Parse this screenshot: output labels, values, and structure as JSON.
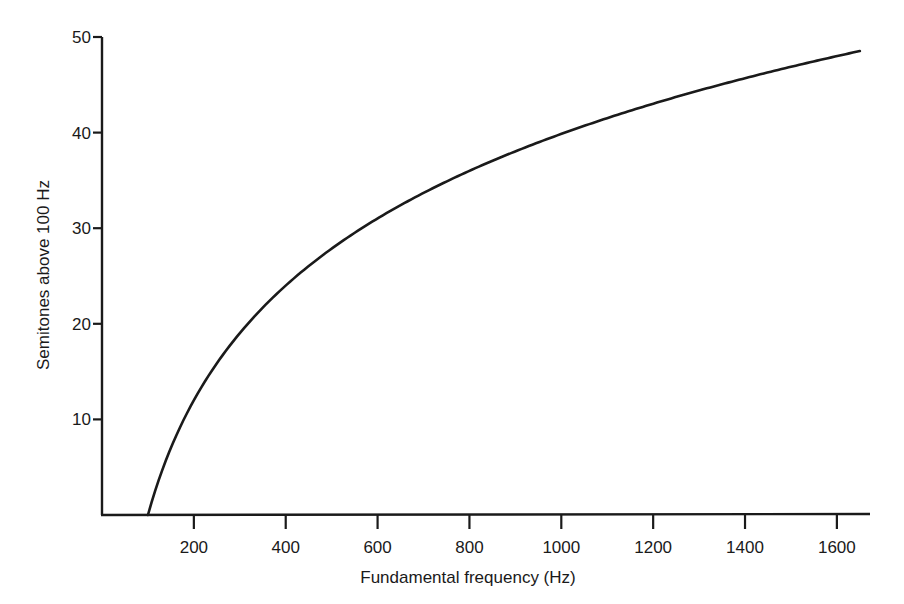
{
  "chart_data": {
    "type": "line",
    "title": "",
    "xlabel": "Fundamental frequency (Hz)",
    "ylabel": "Semitones above 100 Hz",
    "xlim": [
      0,
      1700
    ],
    "ylim": [
      0,
      50
    ],
    "grid": false,
    "legend": null,
    "x_ticks": [
      200,
      400,
      600,
      800,
      1000,
      1200,
      1400,
      1600
    ],
    "y_ticks": [
      10,
      20,
      30,
      40,
      50
    ],
    "series": [
      {
        "name": "Semitones above 100 Hz",
        "x": [
          100,
          125,
          150,
          175,
          200,
          250,
          300,
          350,
          400,
          500,
          600,
          700,
          800,
          900,
          1000,
          1100,
          1200,
          1300,
          1400,
          1500,
          1600,
          1650
        ],
        "y": [
          0,
          3.9,
          7.0,
          9.7,
          12.0,
          15.9,
          19.0,
          21.7,
          24.0,
          27.9,
          31.0,
          33.7,
          36.0,
          38.0,
          39.9,
          41.5,
          43.0,
          44.4,
          45.7,
          46.9,
          48.0,
          48.5
        ]
      }
    ]
  },
  "colors": {
    "line": "#1a1a1a",
    "axis": "#1a1a1a",
    "background": "#ffffff"
  }
}
